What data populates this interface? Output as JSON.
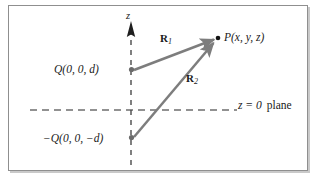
{
  "figure": {
    "background_color": "#ffffff",
    "frame_color": "#8f8f8f",
    "vector_color": "#7d7d7d",
    "axis_color": "#6e6e6e",
    "text_color": "#1a1a1a",
    "labels": {
      "field_point": "P(x, y, z)",
      "positive_charge": "Q(0, 0, d)",
      "negative_charge": "−Q(0, 0, −d)",
      "vector_1": "R",
      "vector_1_sub": "1",
      "vector_2": "R",
      "vector_2_sub": "2",
      "z_axis": "z",
      "plane_eq": "z = 0",
      "plane_word": "plane"
    },
    "geometry": {
      "z_axis_x": 131,
      "z_axis_top": 22,
      "z_axis_bottom": 166,
      "plane_y": 110,
      "plane_x_start": 30,
      "plane_x_end": 237,
      "point_P": [
        218,
        38
      ],
      "point_Q": [
        131,
        70
      ],
      "point_negQ": [
        131,
        138
      ]
    }
  }
}
